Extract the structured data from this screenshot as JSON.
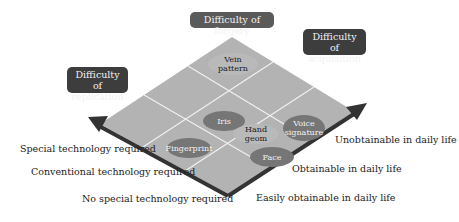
{
  "diagram": {
    "title_tags": {
      "forgery": "Difficulty of forgery",
      "acquisition_line1": "Difficulty of",
      "acquisition_line2": "acquisition",
      "replication_line1": "Difficulty of",
      "replication_line2": "replication"
    },
    "left_axis_labels": [
      "Special technology required",
      "Conventional technology required",
      "No special technology required"
    ],
    "right_axis_labels": [
      "Unobtainable in daily life",
      "Obtainable in daily life",
      "Easily obtainable in daily life"
    ],
    "biometrics": {
      "vein": "Vein pattern",
      "iris": "Iris",
      "hand": "Hand geom",
      "voice_line1": "Voice",
      "voice_line2": "signature",
      "fingerprint": "Fingerprint",
      "face": "Face"
    },
    "colors": {
      "grid_fill": "#b3b3b3",
      "grid_lines": "#f0f0f0",
      "arrow": "#333333",
      "tag": "#5a5a5a",
      "ellipse_dark": "#767676",
      "ellipse_light": "#c4c4c4"
    }
  }
}
